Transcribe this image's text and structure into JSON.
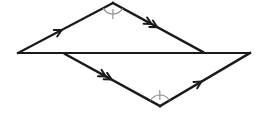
{
  "figure": {
    "background_color": "#ffffff",
    "line_color": "#1a1a1a",
    "mark_color": "#8a8a8a",
    "width": 271,
    "height": 127,
    "points": {
      "left_end": {
        "name": "A",
        "x": 18,
        "y": 53
      },
      "top_apex": {
        "name": "B",
        "x": 113,
        "y": 3
      },
      "upper_right_junction": {
        "name": "C",
        "x": 203,
        "y": 52
      },
      "lower_left_junction": {
        "name": "D",
        "x": 65,
        "y": 54
      },
      "bottom_apex": {
        "name": "E",
        "x": 160,
        "y": 106
      },
      "right_end": {
        "name": "F",
        "x": 250,
        "y": 53
      }
    },
    "segments": [
      {
        "name": "transversal",
        "from": "left_end",
        "to": "right_end",
        "stroke_width": 2.1,
        "marks": 0
      },
      {
        "name": "upper-left-side",
        "from": "left_end",
        "to": "top_apex",
        "stroke_width": 2.1,
        "marks": 1
      },
      {
        "name": "upper-right-side",
        "from": "top_apex",
        "to": "upper_right_junction",
        "stroke_width": 2.4,
        "marks": 2
      },
      {
        "name": "lower-left-side",
        "from": "lower_left_junction",
        "to": "bottom_apex",
        "stroke_width": 2.4,
        "marks": 2
      },
      {
        "name": "lower-right-side",
        "from": "bottom_apex",
        "to": "right_end",
        "stroke_width": 2.4,
        "marks": 1
      }
    ],
    "angle_marks": [
      {
        "name": "top-apex-angle",
        "at": "top_apex",
        "radius": 11,
        "ticks": 1
      },
      {
        "name": "bottom-apex-angle",
        "at": "bottom_apex",
        "radius": 11,
        "ticks": 1
      }
    ]
  }
}
